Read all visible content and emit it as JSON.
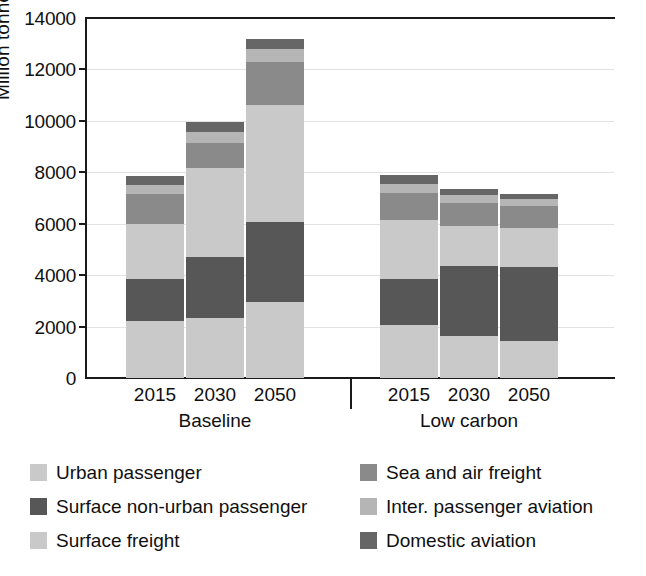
{
  "chart_data": {
    "type": "bar",
    "subtype": "stacked-grouped-bar",
    "title": "",
    "xlabel": "",
    "ylabel": "Million tonnes",
    "ylim": [
      0,
      14000
    ],
    "ytick_values": [
      0,
      2000,
      4000,
      6000,
      8000,
      10000,
      12000,
      14000
    ],
    "ytick_labels": [
      "0",
      "2000",
      "4000",
      "6000",
      "8000",
      "10000",
      "12000",
      "14000"
    ],
    "grid": "horizontal",
    "legend_position": "bottom",
    "stacked": true,
    "groups": [
      {
        "name": "Baseline",
        "categories": [
          "2015",
          "2030",
          "2050"
        ]
      },
      {
        "name": "Low carbon",
        "categories": [
          "2015",
          "2030",
          "2050"
        ]
      }
    ],
    "categories": [
      "2015",
      "2030",
      "2050",
      "2015",
      "2030",
      "2050"
    ],
    "series": [
      {
        "name": "Urban passenger",
        "color": "#c9c9c9",
        "values": [
          2200,
          2350,
          2950,
          2050,
          1650,
          1450
        ]
      },
      {
        "name": "Surface non-urban passenger",
        "color": "#575757",
        "values": [
          1650,
          2350,
          3100,
          1800,
          2700,
          2850
        ]
      },
      {
        "name": "Surface freight",
        "color": "#c9c9c9",
        "values": [
          2150,
          3450,
          4550,
          2300,
          1550,
          1550
        ]
      },
      {
        "name": "Sea and air freight",
        "color": "#8a8a8a",
        "values": [
          1150,
          1000,
          1700,
          1050,
          900,
          850
        ]
      },
      {
        "name": "Inter. passenger aviation",
        "color": "#b5b5b5",
        "values": [
          350,
          400,
          500,
          350,
          300,
          250
        ]
      },
      {
        "name": "Domestic aviation",
        "color": "#666666",
        "values": [
          350,
          400,
          400,
          350,
          250,
          200
        ]
      }
    ],
    "bar_totals": [
      7850,
      9950,
      13200,
      7900,
      7350,
      7150
    ],
    "annotations": []
  },
  "axes": {
    "y_title": "Million tonnes",
    "y_ticks": [
      "14000",
      "12000",
      "10000",
      "8000",
      "6000",
      "4000",
      "2000",
      "0"
    ],
    "x_ticks_baseline": [
      "2015",
      "2030",
      "2050"
    ],
    "x_ticks_lowcarbon": [
      "2015",
      "2030",
      "2050"
    ],
    "group_labels": [
      "Baseline",
      "Low carbon"
    ]
  },
  "legend": {
    "column_left": [
      {
        "label": "Urban passenger",
        "color": "#c9c9c9"
      },
      {
        "label": "Surface non-urban passenger",
        "color": "#575757"
      },
      {
        "label": "Surface freight",
        "color": "#c9c9c9"
      }
    ],
    "column_right": [
      {
        "label": "Sea and air freight",
        "color": "#8a8a8a"
      },
      {
        "label": "Inter. passenger aviation",
        "color": "#b5b5b5"
      },
      {
        "label": "Domestic aviation",
        "color": "#666666"
      }
    ]
  }
}
